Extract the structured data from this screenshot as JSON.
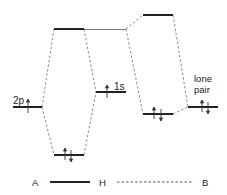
{
  "diagram": {
    "labels": {
      "orbital_2p": "2p",
      "orbital_1s": "1s",
      "lone_pair_line1": "lone",
      "lone_pair_line2": "pair"
    },
    "legend": {
      "atom_a": "A",
      "atom_h": "H",
      "atom_b": "B",
      "covalent_bond": "solid line",
      "hydrogen_bond": "dashed line"
    },
    "colors": {
      "level": "#222222",
      "connector": "#888888",
      "text": "#222222"
    },
    "levels": [
      {
        "id": "2p",
        "x1": 13,
        "x2": 42,
        "y": 107,
        "electrons": "up"
      },
      {
        "id": "sigma-star-AH",
        "x1": 54,
        "x2": 84,
        "y": 29,
        "electrons": ""
      },
      {
        "id": "sigma-AH",
        "x1": 54,
        "x2": 84,
        "y": 155,
        "electrons": "pair"
      },
      {
        "id": "1s",
        "x1": 96,
        "x2": 126,
        "y": 92,
        "electrons": "up"
      },
      {
        "id": "anti-HB",
        "x1": 143,
        "x2": 173,
        "y": 15,
        "electrons": ""
      },
      {
        "id": "bond-HB",
        "x1": 143,
        "x2": 173,
        "y": 114,
        "electrons": "pair"
      },
      {
        "id": "lone-pair",
        "x1": 188,
        "x2": 218,
        "y": 107,
        "electrons": "pair"
      }
    ]
  }
}
